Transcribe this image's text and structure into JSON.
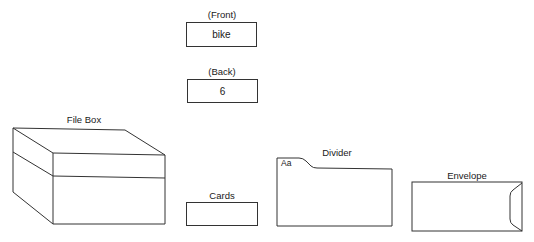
{
  "front": {
    "label": "(Front)",
    "value": "bike"
  },
  "back": {
    "label": "(Back)",
    "value": "6"
  },
  "file_box": {
    "label": "File Box"
  },
  "cards": {
    "label": "Cards"
  },
  "divider": {
    "label": "Divider",
    "tab_text": "Aa"
  },
  "envelope": {
    "label": "Envelope"
  },
  "colors": {
    "line": "#333333",
    "background": "#ffffff"
  }
}
